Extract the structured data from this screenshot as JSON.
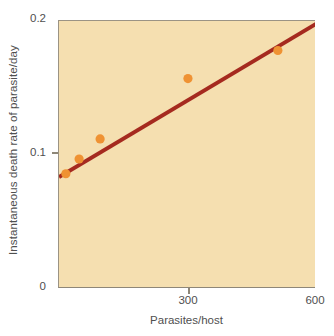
{
  "chart_data": {
    "type": "scatter",
    "title": "",
    "xlabel": "Parasites/host",
    "ylabel": "Instantaneous death rate of parasite/day",
    "xlim": [
      0,
      600
    ],
    "ylim": [
      0,
      0.2
    ],
    "xticks": [
      300,
      600
    ],
    "xtick_labels": [
      "300",
      "600"
    ],
    "yticks": [
      0,
      0.1,
      0.2
    ],
    "ytick_labels": [
      "0",
      "0.1",
      "0.2"
    ],
    "grid": false,
    "legend": null,
    "plot_background_color": "#f5dfb0",
    "point_color": "#ef9233",
    "line_color": "#a52a1f",
    "axis_color": "#8e8778",
    "series": [
      {
        "name": "Observed death rate",
        "type": "scatter",
        "marker": "circle",
        "color": "#ef9233",
        "points": [
          {
            "x": 16,
            "y": 0.086
          },
          {
            "x": 47,
            "y": 0.097
          },
          {
            "x": 96,
            "y": 0.112
          },
          {
            "x": 301,
            "y": 0.157
          },
          {
            "x": 511,
            "y": 0.178
          }
        ]
      },
      {
        "name": "Fitted regression line",
        "type": "line",
        "color": "#a52a1f",
        "points": [
          {
            "x": 0,
            "y": 0.0835
          },
          {
            "x": 600,
            "y": 0.1978
          }
        ]
      }
    ]
  },
  "axes": {
    "y_title": "Instantaneous death rate of parasite/day",
    "y_tick_top": "0.2",
    "y_tick_mid": "0.1",
    "y_tick_bottom": "0",
    "x_title": "Parasites/host",
    "x_tick_mid": "300",
    "x_tick_max": "600"
  }
}
